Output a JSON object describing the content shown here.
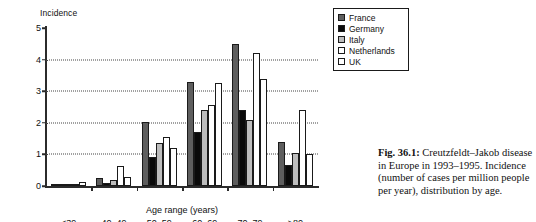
{
  "figure": {
    "caption_number": "Fig. 36.1:",
    "caption_text": " Creutzfeldt–Jakob disease in Europe in 1993–1995. Incidence (number of cases per million people per year), distribution by age."
  },
  "chart_data": {
    "type": "bar",
    "title": "",
    "xlabel": "Age range (years)",
    "ylabel": "Incidence",
    "ylim": [
      0,
      5
    ],
    "yticks": [
      0,
      1,
      2,
      3,
      4,
      5
    ],
    "ytick_labels": [
      "0",
      "1",
      "2",
      "3",
      "4",
      "5"
    ],
    "grid": "horizontal-dotted",
    "legend_position": "top-right",
    "categories": [
      "<39",
      "40–49",
      "50–59",
      "60–69",
      "70–79",
      ">80"
    ],
    "series": [
      {
        "name": "France",
        "color": "#5e5e5e",
        "values": [
          0.03,
          0.25,
          2.02,
          3.3,
          4.5,
          1.4
        ]
      },
      {
        "name": "Germany",
        "color": "#0a0a0a",
        "values": [
          0.02,
          0.1,
          0.92,
          1.7,
          2.4,
          0.65
        ]
      },
      {
        "name": "Italy",
        "color": "#bdbdbd",
        "values": [
          0.03,
          0.2,
          1.35,
          2.4,
          2.1,
          1.05
        ]
      },
      {
        "name": "Netherlands",
        "color": "#ffffff",
        "values": [
          0.07,
          0.62,
          1.55,
          2.55,
          4.2,
          2.4
        ]
      },
      {
        "name": "UK",
        "color": "#ffffff",
        "values": [
          0.14,
          0.27,
          1.2,
          3.25,
          3.4,
          1.0
        ]
      }
    ]
  }
}
